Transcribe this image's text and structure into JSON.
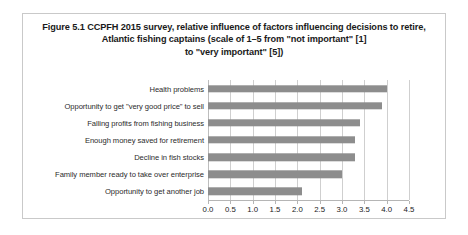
{
  "figure": {
    "title_lines": [
      "Figure 5.1 CCPFH 2015 survey, relative influence of factors influencing decisions to retire,",
      "Atlantic fishing captains (scale of 1–5 from \"not important\" [1]",
      "to \"very important\" [5])"
    ]
  },
  "chart_data": {
    "type": "bar",
    "orientation": "horizontal",
    "title": "Figure 5.1 CCPFH 2015 survey, relative influence of factors influencing decisions to retire, Atlantic fishing captains (scale of 1–5 from \"not important\" [1] to \"very important\" [5])",
    "xlabel": "",
    "ylabel": "",
    "categories": [
      "Health problems",
      "Opportunity to get \"very good price\" to sell",
      "Falling profits from fishing business",
      "Enough money saved for retirement",
      "Decline in fish stocks",
      "Family member ready to take over enterprise",
      "Opportunity to get another job"
    ],
    "values": [
      4.0,
      3.9,
      3.4,
      3.3,
      3.3,
      3.0,
      2.1
    ],
    "xlim": [
      0.0,
      4.5
    ],
    "xticks": [
      "0.0",
      "0.5",
      "1.0",
      "1.5",
      "2.0",
      "2.5",
      "3.0",
      "3.5",
      "4.0",
      "4.5"
    ],
    "xtick_values": [
      0.0,
      0.5,
      1.0,
      1.5,
      2.0,
      2.5,
      3.0,
      3.5,
      4.0,
      4.5
    ],
    "grid": true,
    "legend": false,
    "bar_color": "#8d8d8d",
    "gridline_color": "#cfcfcf",
    "frame_color": "#c9c9c9"
  }
}
